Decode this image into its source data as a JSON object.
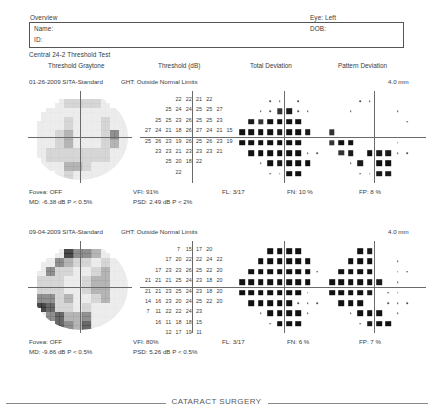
{
  "header": {
    "overview_label": "Overview",
    "eye_label": "Eye: Left",
    "name_label": "Name:",
    "id_label": "ID:",
    "dob_label": "DOB:",
    "test_type_label": "Central 24-2 Threshold Test"
  },
  "columns": {
    "graytone": "Threshold Graytone",
    "threshold": "Threshold (dB)",
    "total_deviation": "Total Deviation",
    "pattern_deviation": "Pattern Deviation"
  },
  "footer": {
    "text": "CATARACT SURGERY"
  },
  "tests": [
    {
      "date": "01-26-2009",
      "strategy": "SITA-Standard",
      "ght": "GHT: Outside Normal Limits",
      "pupil": "4.0 mm",
      "fovea": "Fovea: OFF",
      "vfi": "VFI: 91%",
      "fl": "FL: 3/17",
      "fn": "FN: 10 %",
      "fp": "FP:  8 %",
      "md": "MD: -6.38 dB P < 0.5%",
      "psd": "PSD:  2.49 dB P < 2%",
      "threshold_rows": [
        [
          null,
          null,
          null,
          22,
          22,
          21,
          22,
          null,
          null,
          null
        ],
        [
          null,
          null,
          25,
          24,
          24,
          25,
          25,
          27,
          null,
          null
        ],
        [
          null,
          25,
          25,
          23,
          26,
          25,
          25,
          23,
          null,
          null
        ],
        [
          27,
          24,
          21,
          18,
          26,
          27,
          24,
          21,
          15,
          null
        ],
        [
          25,
          26,
          23,
          19,
          26,
          25,
          26,
          23,
          19,
          null
        ],
        [
          null,
          23,
          23,
          21,
          23,
          23,
          23,
          21,
          null,
          null
        ],
        [
          null,
          null,
          25,
          20,
          18,
          22,
          null,
          null,
          null,
          null
        ],
        [
          null,
          null,
          null,
          22,
          null,
          null,
          null,
          null,
          null,
          null
        ]
      ],
      "total_deviation": [
        [
          0,
          0,
          1,
          0,
          0,
          0,
          0,
          0
        ],
        [
          0,
          0,
          2,
          3,
          0,
          0,
          0,
          0
        ],
        [
          3,
          2,
          4,
          4,
          4,
          4,
          1,
          1
        ],
        [
          4,
          4,
          4,
          4,
          3,
          4,
          4,
          3
        ],
        [
          4,
          4,
          4,
          4,
          4,
          4,
          4,
          1
        ],
        [
          4,
          4,
          4,
          4,
          4,
          4,
          0,
          0
        ],
        [
          0,
          4,
          3,
          4,
          4,
          4,
          0,
          0
        ],
        [
          0,
          0,
          4,
          4,
          4,
          3,
          0,
          0
        ]
      ],
      "pattern_deviation": [
        [
          0,
          0,
          1,
          1,
          0,
          0,
          0,
          0
        ],
        [
          0,
          1,
          1,
          1,
          1,
          0,
          0,
          0
        ],
        [
          1,
          1,
          1,
          1,
          1,
          1,
          1,
          0
        ],
        [
          2,
          1,
          1,
          1,
          1,
          1,
          1,
          1
        ],
        [
          2,
          4,
          4,
          1,
          1,
          1,
          1,
          0
        ],
        [
          2,
          3,
          1,
          4,
          3,
          3,
          0,
          0
        ],
        [
          0,
          3,
          1,
          4,
          4,
          1,
          0,
          0
        ],
        [
          0,
          0,
          3,
          3,
          4,
          0,
          0,
          0
        ]
      ]
    },
    {
      "date": "09-04-2009",
      "strategy": "SITA-Standard",
      "ght": "GHT: Outside Normal Limits",
      "pupil": "4.0 mm",
      "fovea": "Fovea: OFF",
      "vfi": "VFI: 80%",
      "fl": "FL: 3/17",
      "fn": "FN:  6 %",
      "fp": "FP:  7 %",
      "md": "MD: -9.86 dB P < 0.5%",
      "psd": "PSD:  5.26 dB P < 0.5%",
      "threshold_rows": [
        [
          null,
          null,
          null,
          7,
          15,
          17,
          20,
          null,
          null,
          null
        ],
        [
          null,
          null,
          17,
          20,
          22,
          22,
          24,
          22,
          null,
          null
        ],
        [
          null,
          17,
          23,
          23,
          26,
          25,
          22,
          20,
          null,
          null
        ],
        [
          21,
          21,
          21,
          25,
          24,
          23,
          18,
          20,
          null,
          null
        ],
        [
          21,
          21,
          23,
          25,
          24,
          23,
          18,
          20,
          null,
          null
        ],
        [
          14,
          16,
          23,
          20,
          24,
          25,
          22,
          20,
          null,
          null
        ],
        [
          7,
          11,
          22,
          22,
          24,
          23,
          null,
          null,
          null,
          null
        ],
        [
          null,
          16,
          11,
          18,
          18,
          15,
          null,
          null,
          null,
          null
        ],
        [
          null,
          null,
          12,
          17,
          19,
          11,
          null,
          null,
          null,
          null
        ]
      ],
      "total_deviation": [
        [
          4,
          4,
          4,
          4,
          0,
          0,
          0,
          0
        ],
        [
          4,
          4,
          4,
          4,
          4,
          4,
          0,
          0
        ],
        [
          4,
          4,
          4,
          4,
          4,
          4,
          4,
          0
        ],
        [
          4,
          4,
          4,
          4,
          4,
          4,
          4,
          4
        ],
        [
          4,
          4,
          4,
          4,
          4,
          4,
          4,
          0
        ],
        [
          4,
          4,
          4,
          4,
          4,
          0,
          0,
          0
        ],
        [
          0,
          4,
          4,
          4,
          4,
          0,
          0,
          0
        ],
        [
          0,
          4,
          4,
          4,
          4,
          0,
          0,
          0
        ]
      ],
      "pattern_deviation": [
        [
          4,
          3,
          1,
          1,
          0,
          0,
          0,
          0
        ],
        [
          4,
          4,
          4,
          1,
          1,
          0,
          0,
          0
        ],
        [
          4,
          4,
          4,
          4,
          1,
          1,
          0,
          0
        ],
        [
          4,
          4,
          4,
          4,
          4,
          3,
          1,
          0
        ],
        [
          4,
          4,
          4,
          4,
          3,
          1,
          0,
          0
        ],
        [
          4,
          4,
          4,
          1,
          1,
          0,
          0,
          0
        ],
        [
          0,
          4,
          4,
          4,
          1,
          0,
          0,
          0
        ],
        [
          0,
          3,
          4,
          4,
          0,
          0,
          0,
          0
        ]
      ]
    }
  ]
}
